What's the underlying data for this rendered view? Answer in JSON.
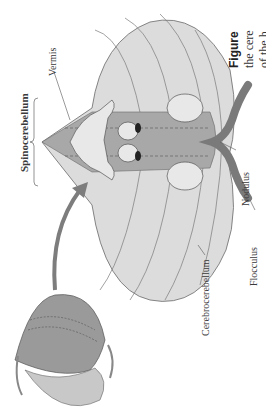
{
  "figure": {
    "caption_prefix": "Figure",
    "caption_line_1": "the cere",
    "caption_line_2": "of the h"
  },
  "labels": {
    "spinocerebellum": "Spinocerebellum",
    "vermis": "Vermis",
    "nodulus": "Nodulus",
    "flocculus": "Flocculus",
    "cerebrocerebellum": "Cerebrocerebellum"
  },
  "colors": {
    "cerebellum_fill": "#dcdcdc",
    "vermis_fill": "#9e9e9e",
    "nodulus_fill": "#7a7a7a",
    "outline": "#6a6a6a",
    "arrow": "#7d7d7d"
  }
}
